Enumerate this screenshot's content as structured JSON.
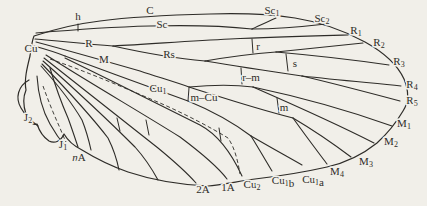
{
  "figure": {
    "figure_type": "insect-wing-venation-diagram",
    "colors": {
      "background": "#f1efe9",
      "ink": "#2e2c28"
    },
    "labels": [
      {
        "id": "label-h",
        "x": 78,
        "y": 17,
        "parts": [
          {
            "t": "h"
          }
        ]
      },
      {
        "id": "label-c",
        "x": 150,
        "y": 11,
        "parts": [
          {
            "t": "C"
          }
        ]
      },
      {
        "id": "label-sc",
        "x": 162,
        "y": 25,
        "parts": [
          {
            "t": "Sc"
          }
        ]
      },
      {
        "id": "label-sc1",
        "x": 272,
        "y": 11,
        "parts": [
          {
            "t": "Sc"
          },
          {
            "t": "1",
            "sub": true
          }
        ]
      },
      {
        "id": "label-sc2",
        "x": 322,
        "y": 19,
        "parts": [
          {
            "t": "Sc"
          },
          {
            "t": "2",
            "sub": true
          }
        ]
      },
      {
        "id": "label-r1",
        "x": 356,
        "y": 31,
        "parts": [
          {
            "t": "R"
          },
          {
            "t": "1",
            "sub": true
          }
        ]
      },
      {
        "id": "label-r2",
        "x": 379,
        "y": 43,
        "parts": [
          {
            "t": "R"
          },
          {
            "t": "2",
            "sub": true
          }
        ]
      },
      {
        "id": "label-r3",
        "x": 399,
        "y": 62,
        "parts": [
          {
            "t": "R"
          },
          {
            "t": "3",
            "sub": true
          }
        ]
      },
      {
        "id": "label-r4",
        "x": 412,
        "y": 85,
        "parts": [
          {
            "t": "R"
          },
          {
            "t": "4",
            "sub": true
          }
        ]
      },
      {
        "id": "label-r5",
        "x": 412,
        "y": 101,
        "parts": [
          {
            "t": "R"
          },
          {
            "t": "5",
            "sub": true
          }
        ]
      },
      {
        "id": "label-m1",
        "x": 404,
        "y": 124,
        "parts": [
          {
            "t": "M"
          },
          {
            "t": "1",
            "sub": true
          }
        ]
      },
      {
        "id": "label-m2",
        "x": 391,
        "y": 142,
        "parts": [
          {
            "t": "M"
          },
          {
            "t": "2",
            "sub": true
          }
        ]
      },
      {
        "id": "label-m3",
        "x": 366,
        "y": 162,
        "parts": [
          {
            "t": "M"
          },
          {
            "t": "3",
            "sub": true
          }
        ]
      },
      {
        "id": "label-m4",
        "x": 337,
        "y": 172,
        "parts": [
          {
            "t": "M"
          },
          {
            "t": "4",
            "sub": true
          }
        ]
      },
      {
        "id": "label-cu1a",
        "x": 313,
        "y": 180,
        "parts": [
          {
            "t": "Cu"
          },
          {
            "t": "1",
            "sub": true
          },
          {
            "t": "a"
          }
        ]
      },
      {
        "id": "label-cu1b",
        "x": 283,
        "y": 181,
        "parts": [
          {
            "t": "Cu"
          },
          {
            "t": "1",
            "sub": true
          },
          {
            "t": "b"
          }
        ]
      },
      {
        "id": "label-cu2",
        "x": 252,
        "y": 185,
        "parts": [
          {
            "t": "Cu"
          },
          {
            "t": "2",
            "sub": true
          }
        ]
      },
      {
        "id": "label-1a",
        "x": 228,
        "y": 188,
        "parts": [
          {
            "t": "1A"
          }
        ]
      },
      {
        "id": "label-2a",
        "x": 203,
        "y": 190,
        "parts": [
          {
            "t": "2A"
          }
        ]
      },
      {
        "id": "label-na",
        "x": 79,
        "y": 158,
        "parts": [
          {
            "t": "n",
            "italic": true
          },
          {
            "t": "A"
          }
        ]
      },
      {
        "id": "label-j1",
        "x": 63,
        "y": 145,
        "parts": [
          {
            "t": "J"
          },
          {
            "t": "1",
            "sub": true
          }
        ]
      },
      {
        "id": "label-j2",
        "x": 28,
        "y": 118,
        "parts": [
          {
            "t": "J"
          },
          {
            "t": "2",
            "sub": true
          }
        ]
      },
      {
        "id": "label-r",
        "x": 89,
        "y": 44,
        "parts": [
          {
            "t": "R"
          }
        ]
      },
      {
        "id": "label-rs",
        "x": 169,
        "y": 55,
        "parts": [
          {
            "t": "Rs"
          }
        ]
      },
      {
        "id": "label-m",
        "x": 104,
        "y": 60,
        "parts": [
          {
            "t": "M"
          }
        ]
      },
      {
        "id": "label-cu",
        "x": 31,
        "y": 49,
        "parts": [
          {
            "t": "Cu"
          }
        ]
      },
      {
        "id": "label-cu1",
        "x": 158,
        "y": 89,
        "parts": [
          {
            "t": "Cu"
          },
          {
            "t": "1",
            "sub": true
          }
        ]
      },
      {
        "id": "label-xv-r",
        "x": 258,
        "y": 47,
        "parts": [
          {
            "t": "r"
          }
        ]
      },
      {
        "id": "label-xv-s",
        "x": 295,
        "y": 64,
        "parts": [
          {
            "t": "s"
          }
        ]
      },
      {
        "id": "label-xv-rm",
        "x": 251,
        "y": 78,
        "parts": [
          {
            "t": "r–m"
          }
        ]
      },
      {
        "id": "label-xv-m",
        "x": 284,
        "y": 108,
        "parts": [
          {
            "t": "m"
          }
        ]
      },
      {
        "id": "label-xv-mcu",
        "x": 204,
        "y": 98,
        "parts": [
          {
            "t": "m–Cu"
          }
        ]
      }
    ]
  }
}
